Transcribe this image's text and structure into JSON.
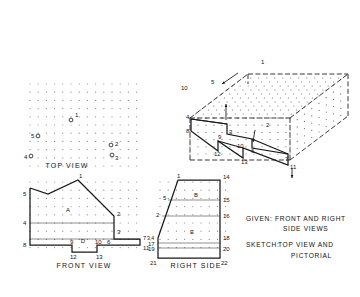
{
  "sheet": {
    "background": "#ffffff",
    "ink": "#181818",
    "grid_dot_color": "#8d8d8d"
  },
  "views": {
    "top": {
      "title": "TOP VIEW",
      "grid": {
        "cols": 14,
        "rows": 11,
        "spacing": 8.2,
        "origin_x": 30,
        "origin_y": 84
      },
      "points": [
        {
          "label": "1",
          "x": 71,
          "y": 120,
          "label_dx": 4,
          "label_dy": -3
        },
        {
          "label": "5",
          "x": 38,
          "y": 136,
          "label_dx": -7,
          "label_dy": 2
        },
        {
          "label": "2",
          "x": 111,
          "y": 145,
          "label_dx": 4,
          "label_dy": 1
        },
        {
          "label": "3",
          "x": 112,
          "y": 155,
          "label_dx": 3,
          "label_dy": 5
        },
        {
          "label": "4",
          "x": 31,
          "y": 156,
          "label_dx": -7,
          "label_dy": 3
        }
      ]
    },
    "front": {
      "title": "FRONT VIEW",
      "grid": {
        "cols": 14,
        "rows": 9,
        "spacing": 8.2,
        "origin_x": 30,
        "origin_y": 182
      },
      "outline": [
        [
          30,
          188
        ],
        [
          30,
          223
        ],
        [
          30,
          239
        ],
        [
          30,
          245
        ],
        [
          72,
          245
        ],
        [
          72,
          252
        ],
        [
          97,
          252
        ],
        [
          97,
          245
        ],
        [
          140,
          245
        ],
        [
          140,
          239
        ],
        [
          114,
          239
        ],
        [
          114,
          223
        ],
        [
          114,
          216
        ],
        [
          78,
          180
        ],
        [
          48,
          194
        ],
        [
          30,
          188
        ]
      ],
      "construction_lines": [
        {
          "x1": 30,
          "y1": 223,
          "x2": 114,
          "y2": 223
        },
        {
          "x1": 30,
          "y1": 239,
          "x2": 140,
          "y2": 239
        }
      ],
      "surfaces": [
        {
          "label": "A",
          "x": 68,
          "y": 212
        },
        {
          "label": "D",
          "x": 83,
          "y": 243
        }
      ],
      "points": [
        {
          "label": "1",
          "x": 78,
          "y": 180,
          "label_dx": 1,
          "label_dy": -2
        },
        {
          "label": "5",
          "x": 30,
          "y": 194,
          "label_dx": -7,
          "label_dy": 2
        },
        {
          "label": "2",
          "x": 114,
          "y": 216,
          "label_dx": 3,
          "label_dy": 0
        },
        {
          "label": "3",
          "x": 114,
          "y": 233,
          "label_dx": 3,
          "label_dy": 1
        },
        {
          "label": "4",
          "x": 30,
          "y": 223,
          "label_dx": -7,
          "label_dy": 2
        },
        {
          "label": "6",
          "x": 108,
          "y": 239,
          "label_dx": -1,
          "label_dy": 5
        },
        {
          "label": "7",
          "x": 140,
          "y": 239,
          "label_dx": 3,
          "label_dy": 1
        },
        {
          "label": "11",
          "x": 140,
          "y": 245,
          "label_dx": 3,
          "label_dy": 5
        },
        {
          "label": "8",
          "x": 30,
          "y": 245,
          "label_dx": -7,
          "label_dy": 2
        },
        {
          "label": "9",
          "x": 72,
          "y": 245,
          "label_dx": -2,
          "label_dy": -1
        },
        {
          "label": "10",
          "x": 97,
          "y": 245,
          "label_dx": -2,
          "label_dy": -1
        },
        {
          "label": "12",
          "x": 72,
          "y": 252,
          "label_dx": -2,
          "label_dy": 7
        },
        {
          "label": "13",
          "x": 97,
          "y": 252,
          "label_dx": -1,
          "label_dy": 7
        }
      ]
    },
    "right_side": {
      "title": "RIGHT SIDE",
      "grid": {
        "cols": 9,
        "rows": 9,
        "spacing": 8.2,
        "origin_x": 160,
        "origin_y": 182
      },
      "outline": [
        [
          158,
          238
        ],
        [
          158,
          243
        ],
        [
          158,
          248
        ],
        [
          158,
          258
        ],
        [
          220,
          258
        ],
        [
          220,
          248
        ],
        [
          220,
          243
        ],
        [
          220,
          238
        ],
        [
          220,
          216
        ],
        [
          220,
          200
        ],
        [
          220,
          180
        ],
        [
          178,
          180
        ],
        [
          158,
          238
        ]
      ],
      "construction_lines": [
        {
          "x1": 168,
          "y1": 200,
          "x2": 220,
          "y2": 200
        },
        {
          "x1": 162,
          "y1": 216,
          "x2": 220,
          "y2": 216
        },
        {
          "x1": 158,
          "y1": 243,
          "x2": 220,
          "y2": 243
        },
        {
          "x1": 158,
          "y1": 248,
          "x2": 220,
          "y2": 248
        }
      ],
      "surfaces": [
        {
          "label": "B",
          "x": 196,
          "y": 197
        },
        {
          "label": "E",
          "x": 192,
          "y": 234
        }
      ],
      "points": [
        {
          "label": "1",
          "x": 178,
          "y": 180,
          "label_dx": -1,
          "label_dy": -2
        },
        {
          "label": "14",
          "x": 220,
          "y": 180,
          "label_dx": 3,
          "label_dy": -1
        },
        {
          "label": "5",
          "x": 168,
          "y": 200,
          "label_dx": -5,
          "label_dy": 0
        },
        {
          "label": "15",
          "x": 220,
          "y": 200,
          "label_dx": 3,
          "label_dy": 2
        },
        {
          "label": "2",
          "x": 162,
          "y": 216,
          "label_dx": -6,
          "label_dy": 1
        },
        {
          "label": "16",
          "x": 220,
          "y": 216,
          "label_dx": 3,
          "label_dy": 2
        },
        {
          "label": "3,4",
          "x": 158,
          "y": 238,
          "label_dx": -11,
          "label_dy": 2
        },
        {
          "label": "18",
          "x": 220,
          "y": 238,
          "label_dx": 3,
          "label_dy": 2
        },
        {
          "label": "17",
          "x": 158,
          "y": 243,
          "label_dx": -10,
          "label_dy": 3
        },
        {
          "label": "20",
          "x": 220,
          "y": 248,
          "label_dx": 3,
          "label_dy": 3
        },
        {
          "label": "19",
          "x": 158,
          "y": 248,
          "label_dx": -10,
          "label_dy": 3
        },
        {
          "label": "21",
          "x": 158,
          "y": 258,
          "label_dx": -8,
          "label_dy": 7
        },
        {
          "label": "22",
          "x": 220,
          "y": 258,
          "label_dx": 1,
          "label_dy": 7
        }
      ]
    },
    "pictorial": {
      "title": "",
      "box": {
        "front_top_left": [
          190,
          118
        ],
        "front_top_right": [
          290,
          118
        ],
        "front_bot_left": [
          190,
          160
        ],
        "front_bot_right": [
          290,
          160
        ],
        "rear_offset_x": 58,
        "rear_offset_y": -44
      },
      "points": [
        {
          "label": "1",
          "x": 258,
          "y": 66,
          "label_dx": 3,
          "label_dy": -2
        },
        {
          "label": "5",
          "x": 215,
          "y": 80,
          "label_dx": -4,
          "label_dy": 4
        },
        {
          "label": "4",
          "x": 191,
          "y": 119,
          "label_dx": -5,
          "label_dy": 0
        },
        {
          "label": "10",
          "x": 188,
          "y": 88,
          "label_dx": -7,
          "label_dy": 2
        },
        {
          "label": "8",
          "x": 191,
          "y": 131,
          "label_dx": -5,
          "label_dy": 2
        },
        {
          "label": "9",
          "x": 222,
          "y": 136,
          "label_dx": -4,
          "label_dy": 3
        },
        {
          "label": "3",
          "x": 227,
          "y": 134,
          "label_dx": 2,
          "label_dy": 0
        },
        {
          "label": "12",
          "x": 218,
          "y": 151,
          "label_dx": -4,
          "label_dy": 5
        },
        {
          "label": "13",
          "x": 243,
          "y": 158,
          "label_dx": -2,
          "label_dy": 6
        },
        {
          "label": "10",
          "x": 238,
          "y": 147,
          "label_dx": -1,
          "label_dy": 1
        },
        {
          "label": "6",
          "x": 252,
          "y": 148,
          "label_dx": -1,
          "label_dy": 5
        },
        {
          "label": "2",
          "x": 263,
          "y": 129,
          "label_dx": 3,
          "label_dy": -2
        },
        {
          "label": "7",
          "x": 283,
          "y": 158,
          "label_dx": 2,
          "label_dy": 3
        },
        {
          "label": "11",
          "x": 288,
          "y": 165,
          "label_dx": 2,
          "label_dy": 4
        }
      ]
    }
  },
  "notes": {
    "given_label": "GIVEN:",
    "given_line1": "FRONT AND RIGHT",
    "given_line2": "SIDE VIEWS",
    "sketch_label": "SKETCH:",
    "sketch_line1": "TOP VIEW AND",
    "sketch_line2": "PICTORIAL"
  }
}
